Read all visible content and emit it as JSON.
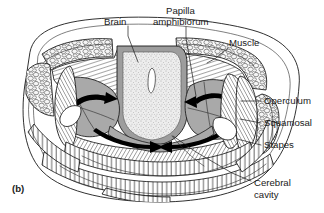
{
  "figure": {
    "panel_label": "(b)",
    "background_color": "#ffffff",
    "ink_color": "#1a1a1a",
    "caption_font_size_px": 9.6,
    "width_px": 324,
    "height_px": 213
  },
  "labels": [
    {
      "id": "brain",
      "text": "Brain",
      "x": 104,
      "y": 22,
      "anchor": "start",
      "leader": "M 128 26 L 128 36 L 138 62",
      "target": "central stippled brain mass"
    },
    {
      "id": "papilla-amphibiorum",
      "text_line_1": "Papilla",
      "text_line_2": "amphibiorum",
      "x": 165,
      "y": 12,
      "y2": 23,
      "anchor": "start",
      "leader": "M 186 27 L 186 38 L 195 96",
      "target": "inner ear papilla region"
    },
    {
      "id": "muscle",
      "text": "Muscle",
      "x": 228,
      "y": 45,
      "anchor": "start",
      "leader": "M 226 48 L 214 58 L 206 62",
      "target": "cellular textured muscle mass"
    },
    {
      "id": "operculum",
      "text": "Operculum",
      "x": 263,
      "y": 104,
      "anchor": "start",
      "leader": "M 261 101 L 243 101",
      "target": "operculum plate"
    },
    {
      "id": "squamosal",
      "text": "Squamosal",
      "x": 263,
      "y": 126,
      "anchor": "start",
      "leader": "M 261 123 L 240 120",
      "target": "squamosal bone"
    },
    {
      "id": "stapes",
      "text": "Stapes",
      "x": 263,
      "y": 148,
      "anchor": "start",
      "leader": "M 261 145 L 238 140",
      "target": "stapes columella"
    },
    {
      "id": "cerebral-cavity",
      "text_line_1": "Cerebral",
      "text_line_2": "cavity",
      "x": 253,
      "y": 185,
      "y2": 197,
      "anchor": "start",
      "leader": "M 251 181 L 230 172 L 195 152 L 172 135",
      "target": "cerebral cavity space"
    }
  ],
  "structures": [
    {
      "id": "head-outline",
      "name": "outer head outline",
      "fill": "#ffffff"
    },
    {
      "id": "muscle-mass-left",
      "name": "left muscle mass",
      "texture": "cellular",
      "fill": "#f2f2f2"
    },
    {
      "id": "muscle-mass-right",
      "name": "right muscle mass",
      "texture": "cellular",
      "fill": "#f2f2f2"
    },
    {
      "id": "brain",
      "name": "brain",
      "texture": "stipple",
      "fill": "#e6e6e6"
    },
    {
      "id": "ventricle",
      "name": "brain ventricle",
      "fill": "#ffffff"
    },
    {
      "id": "skull-hatched",
      "name": "hatched skull bone",
      "texture": "hatching",
      "fill": "#ffffff"
    },
    {
      "id": "otic-capsule-left",
      "name": "left otic capsule",
      "fill": "#a9a9a9"
    },
    {
      "id": "otic-capsule-right",
      "name": "right otic capsule",
      "fill": "#a9a9a9"
    },
    {
      "id": "operculum",
      "name": "operculum",
      "texture": "hatching"
    },
    {
      "id": "squamosal",
      "name": "squamosal",
      "texture": "hatching"
    },
    {
      "id": "stapes",
      "name": "stapes",
      "fill": "#ffffff"
    },
    {
      "id": "cerebral-cavity",
      "name": "cerebral cavity",
      "fill": "#ffffff"
    },
    {
      "id": "lower-bands",
      "name": "lower hatched bands",
      "texture": "hatching"
    },
    {
      "id": "sound-path-arrows",
      "name": "sound transmission arrows",
      "fill": "#000000"
    }
  ],
  "colors": {
    "ink": "#1a1a1a",
    "gray_capsule": "#a9a9a9",
    "brain_fill": "#e6e6e6",
    "muscle_fill": "#f2f2f2",
    "background": "#ffffff"
  }
}
